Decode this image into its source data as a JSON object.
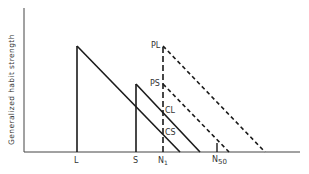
{
  "diagram": {
    "y_axis_label": "Generalized habit strength",
    "x_labels": {
      "L": "L",
      "S": "S",
      "N1_main": "N",
      "N1_sub": "1",
      "N50_main": "N",
      "N50_sub": "50"
    },
    "point_labels": {
      "PL": "PL",
      "PS": "PS",
      "CL": "CL",
      "CS": "CS"
    },
    "lines": [
      {
        "name": "L-gradient",
        "style": "solid",
        "from": [
          77,
          46
        ],
        "to": [
          180,
          152
        ]
      },
      {
        "name": "S-gradient",
        "style": "solid",
        "from": [
          136,
          84
        ],
        "to": [
          200,
          152
        ]
      },
      {
        "name": "PL-gradient",
        "style": "dashed",
        "from": [
          163,
          46
        ],
        "to": [
          265,
          152
        ]
      },
      {
        "name": "PS-gradient",
        "style": "dashed",
        "from": [
          163,
          84
        ],
        "to": [
          229,
          152
        ]
      }
    ],
    "colors": {
      "line": "#1a1a1a",
      "text": "#333333"
    }
  }
}
